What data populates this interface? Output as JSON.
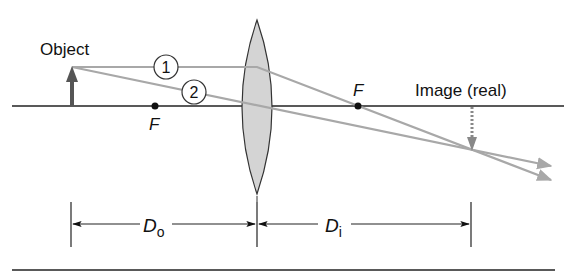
{
  "diagram": {
    "labels": {
      "object": "Object",
      "image": "Image (real)",
      "focal_left": "F",
      "focal_right": "F",
      "ray1": "1",
      "ray2": "2",
      "do_main": "D",
      "do_sub": "o",
      "di_main": "D",
      "di_sub": "i"
    },
    "colors": {
      "ray": "#a8a8a8",
      "lens_fill": "#d4d4d4",
      "object_arrow": "#555555",
      "image_arrow": "#888888",
      "axis": "#222222"
    }
  }
}
